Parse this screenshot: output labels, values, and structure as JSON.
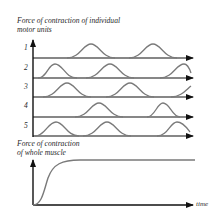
{
  "top_panel": {
    "title_line1": "Force of contraction of individual",
    "title_line2": "motor units",
    "rows": [
      {
        "label": "1",
        "baseline_y": 58,
        "peaks_x": [
          91,
          153
        ]
      },
      {
        "label": "2",
        "baseline_y": 78,
        "peaks_x": [
          55,
          110,
          184
        ]
      },
      {
        "label": "3",
        "baseline_y": 97,
        "peaks_x": [
          67,
          130,
          195
        ]
      },
      {
        "label": "4",
        "baseline_y": 117,
        "peaks_x": [
          99,
          163
        ]
      },
      {
        "label": "5",
        "baseline_y": 136,
        "peaks_x": [
          56,
          107,
          177
        ]
      }
    ]
  },
  "bottom_panel": {
    "title_line1": "Force of contraction",
    "title_line2": "of whole muscle",
    "x_label": "time"
  },
  "colors": {
    "axis": "#111111",
    "curve": "#7a7a7a",
    "text": "#2a2a2a"
  }
}
